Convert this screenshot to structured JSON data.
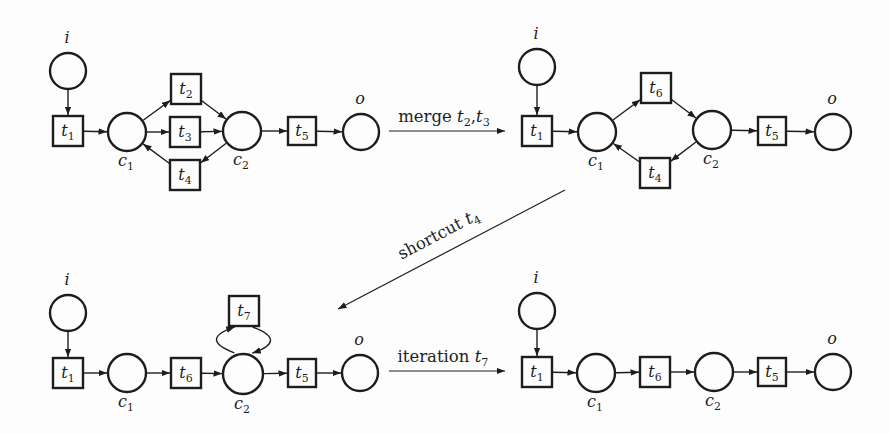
{
  "diagram": {
    "canvas": {
      "width": 890,
      "height": 433,
      "background": "#fdfdfd",
      "ink": "#1d1d1d"
    },
    "nets": [
      {
        "name": "net-original",
        "nodes": [
          {
            "id": "i",
            "kind": "place",
            "x": 68,
            "y": 71,
            "r": 18,
            "label": {
              "t": "i"
            },
            "label_pos": "above"
          },
          {
            "id": "t1",
            "kind": "transition",
            "x": 68,
            "y": 131,
            "s": 30,
            "label": {
              "t": "t",
              "sub": "1"
            }
          },
          {
            "id": "c1",
            "kind": "place",
            "x": 127,
            "y": 132,
            "r": 19,
            "label": {
              "t": "c",
              "sub": "1"
            },
            "label_pos": "below"
          },
          {
            "id": "t2",
            "kind": "transition",
            "x": 186,
            "y": 89,
            "s": 30,
            "label": {
              "t": "t",
              "sub": "2"
            }
          },
          {
            "id": "t3",
            "kind": "transition",
            "x": 185,
            "y": 132,
            "s": 30,
            "label": {
              "t": "t",
              "sub": "3"
            }
          },
          {
            "id": "t4",
            "kind": "transition",
            "x": 185,
            "y": 175,
            "s": 30,
            "label": {
              "t": "t",
              "sub": "4"
            }
          },
          {
            "id": "c2",
            "kind": "place",
            "x": 242,
            "y": 131,
            "r": 19,
            "label": {
              "t": "c",
              "sub": "2"
            },
            "label_pos": "below"
          },
          {
            "id": "t5",
            "kind": "transition",
            "x": 302,
            "y": 131,
            "s": 28,
            "label": {
              "t": "t",
              "sub": "5"
            }
          },
          {
            "id": "o",
            "kind": "place",
            "x": 361,
            "y": 132,
            "r": 18,
            "label": {
              "t": "o"
            },
            "label_pos": "above"
          }
        ],
        "arcs": [
          {
            "from": "i",
            "to": "t1"
          },
          {
            "from": "t1",
            "to": "c1"
          },
          {
            "from": "c1",
            "to": "t2"
          },
          {
            "from": "c1",
            "to": "t3"
          },
          {
            "from": "t2",
            "to": "c2"
          },
          {
            "from": "t3",
            "to": "c2"
          },
          {
            "from": "c2",
            "to": "t4"
          },
          {
            "from": "t4",
            "to": "c1"
          },
          {
            "from": "c2",
            "to": "t5"
          },
          {
            "from": "t5",
            "to": "o"
          }
        ]
      },
      {
        "name": "net-after-merge",
        "nodes": [
          {
            "id": "i",
            "kind": "place",
            "x": 537,
            "y": 67,
            "r": 18,
            "label": {
              "t": "i"
            },
            "label_pos": "above"
          },
          {
            "id": "t1",
            "kind": "transition",
            "x": 537,
            "y": 131,
            "s": 30,
            "label": {
              "t": "t",
              "sub": "1"
            }
          },
          {
            "id": "c1",
            "kind": "place",
            "x": 597,
            "y": 132,
            "r": 19,
            "label": {
              "t": "c",
              "sub": "1"
            },
            "label_pos": "below"
          },
          {
            "id": "t6",
            "kind": "transition",
            "x": 656,
            "y": 88,
            "s": 30,
            "label": {
              "t": "t",
              "sub": "6"
            }
          },
          {
            "id": "t4",
            "kind": "transition",
            "x": 655,
            "y": 173,
            "s": 30,
            "label": {
              "t": "t",
              "sub": "4"
            }
          },
          {
            "id": "c2",
            "kind": "place",
            "x": 712,
            "y": 130,
            "r": 19,
            "label": {
              "t": "c",
              "sub": "2"
            },
            "label_pos": "below"
          },
          {
            "id": "t5",
            "kind": "transition",
            "x": 772,
            "y": 131,
            "s": 28,
            "label": {
              "t": "t",
              "sub": "5"
            }
          },
          {
            "id": "o",
            "kind": "place",
            "x": 833,
            "y": 132,
            "r": 18,
            "label": {
              "t": "o"
            },
            "label_pos": "above"
          }
        ],
        "arcs": [
          {
            "from": "i",
            "to": "t1"
          },
          {
            "from": "t1",
            "to": "c1"
          },
          {
            "from": "c1",
            "to": "t6"
          },
          {
            "from": "t6",
            "to": "c2"
          },
          {
            "from": "c2",
            "to": "t4"
          },
          {
            "from": "t4",
            "to": "c1"
          },
          {
            "from": "c2",
            "to": "t5"
          },
          {
            "from": "t5",
            "to": "o"
          }
        ]
      },
      {
        "name": "net-after-shortcut",
        "nodes": [
          {
            "id": "i",
            "kind": "place",
            "x": 68,
            "y": 313,
            "r": 18,
            "label": {
              "t": "i"
            },
            "label_pos": "above"
          },
          {
            "id": "t1",
            "kind": "transition",
            "x": 68,
            "y": 373,
            "s": 30,
            "label": {
              "t": "t",
              "sub": "1"
            }
          },
          {
            "id": "c1",
            "kind": "place",
            "x": 127,
            "y": 373,
            "r": 19,
            "label": {
              "t": "c",
              "sub": "1"
            },
            "label_pos": "below"
          },
          {
            "id": "t6",
            "kind": "transition",
            "x": 186,
            "y": 373,
            "s": 30,
            "label": {
              "t": "t",
              "sub": "6"
            }
          },
          {
            "id": "t7",
            "kind": "transition",
            "x": 244,
            "y": 311,
            "s": 30,
            "label": {
              "t": "t",
              "sub": "7"
            }
          },
          {
            "id": "c2",
            "kind": "place",
            "x": 243,
            "y": 374,
            "r": 20,
            "label": {
              "t": "c",
              "sub": "2"
            },
            "label_pos": "below"
          },
          {
            "id": "t5",
            "kind": "transition",
            "x": 302,
            "y": 373,
            "s": 28,
            "label": {
              "t": "t",
              "sub": "5"
            }
          },
          {
            "id": "o",
            "kind": "place",
            "x": 360,
            "y": 373,
            "r": 18,
            "label": {
              "t": "o"
            },
            "label_pos": "above"
          }
        ],
        "arcs": [
          {
            "from": "i",
            "to": "t1"
          },
          {
            "from": "t1",
            "to": "c1"
          },
          {
            "from": "c1",
            "to": "t6"
          },
          {
            "from": "t6",
            "to": "c2"
          },
          {
            "from": "c2",
            "to": "t7",
            "bend": 36,
            "shift": 9
          },
          {
            "from": "t7",
            "to": "c2",
            "bend": 36,
            "shift": 9
          },
          {
            "from": "c2",
            "to": "t5"
          },
          {
            "from": "t5",
            "to": "o"
          }
        ]
      },
      {
        "name": "net-after-iteration",
        "nodes": [
          {
            "id": "i",
            "kind": "place",
            "x": 537,
            "y": 311,
            "r": 18,
            "label": {
              "t": "i"
            },
            "label_pos": "above"
          },
          {
            "id": "t1",
            "kind": "transition",
            "x": 537,
            "y": 372,
            "s": 30,
            "label": {
              "t": "t",
              "sub": "1"
            }
          },
          {
            "id": "c1",
            "kind": "place",
            "x": 596,
            "y": 373,
            "r": 19,
            "label": {
              "t": "c",
              "sub": "1"
            },
            "label_pos": "below"
          },
          {
            "id": "t6",
            "kind": "transition",
            "x": 655,
            "y": 372,
            "s": 30,
            "label": {
              "t": "t",
              "sub": "6"
            }
          },
          {
            "id": "c2",
            "kind": "place",
            "x": 714,
            "y": 372,
            "r": 19,
            "label": {
              "t": "c",
              "sub": "2"
            },
            "label_pos": "below"
          },
          {
            "id": "t5",
            "kind": "transition",
            "x": 772,
            "y": 372,
            "s": 28,
            "label": {
              "t": "t",
              "sub": "5"
            }
          },
          {
            "id": "o",
            "kind": "place",
            "x": 833,
            "y": 372,
            "r": 18,
            "label": {
              "t": "o"
            },
            "label_pos": "above"
          }
        ],
        "arcs": [
          {
            "from": "i",
            "to": "t1"
          },
          {
            "from": "t1",
            "to": "c1"
          },
          {
            "from": "c1",
            "to": "t6"
          },
          {
            "from": "t6",
            "to": "c2"
          },
          {
            "from": "c2",
            "to": "t5"
          },
          {
            "from": "t5",
            "to": "o"
          }
        ]
      }
    ],
    "transformations": [
      {
        "name": "merge",
        "label_text": "merge t2,t3",
        "segments": [
          {
            "t": "merge ",
            "it": false
          },
          {
            "t": "t",
            "it": true,
            "sub": "2"
          },
          {
            "t": ",",
            "it": false
          },
          {
            "t": "t",
            "it": true,
            "sub": "3"
          }
        ],
        "x1": 389,
        "y1": 131,
        "x2": 505,
        "y2": 131,
        "lx": 444,
        "ly": 122,
        "angle": 0
      },
      {
        "name": "shortcut",
        "label_text": "shortcut t4",
        "segments": [
          {
            "t": "shortcut ",
            "it": false
          },
          {
            "t": "t",
            "it": true,
            "sub": "4"
          }
        ],
        "x1": 565,
        "y1": 190,
        "x2": 338,
        "y2": 309,
        "lx": 441,
        "ly": 239,
        "angle": -27.6
      },
      {
        "name": "iteration",
        "label_text": "iteration t7",
        "segments": [
          {
            "t": "iteration ",
            "it": false
          },
          {
            "t": "t",
            "it": true,
            "sub": "7"
          }
        ],
        "x1": 389,
        "y1": 371,
        "x2": 505,
        "y2": 371,
        "lx": 443,
        "ly": 362,
        "angle": 0
      }
    ]
  }
}
